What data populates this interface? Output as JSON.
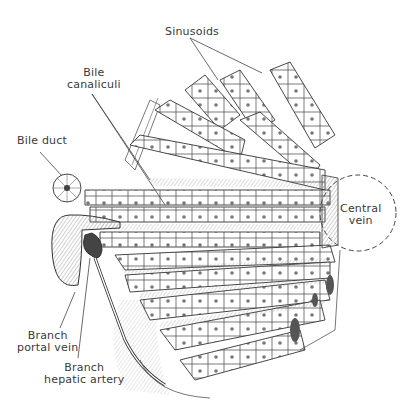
{
  "diagram": {
    "labels": {
      "sinusoids": "Sinusoids",
      "bile_canaliculi_1": "Bile",
      "bile_canaliculi_2": "canaliculi",
      "bile_duct": "Bile duct",
      "central_vein_1": "Central",
      "central_vein_2": "vein",
      "portal_vein_1": "Branch",
      "portal_vein_2": "portal vein",
      "hepatic_artery_1": "Branch",
      "hepatic_artery_2": "hepatic artery"
    },
    "colors": {
      "line": "#3a3a3a",
      "shade": "#9a9a9a",
      "dark": "#555555",
      "paper": "#ffffff"
    }
  }
}
